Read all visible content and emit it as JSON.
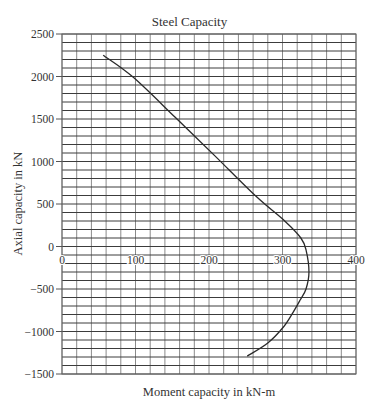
{
  "chart_data": {
    "type": "line",
    "title": "Steel Capacity",
    "xlabel": "Moment capacity in kN-m",
    "ylabel": "Axial capacity in kN",
    "xlim": [
      0,
      400
    ],
    "ylim": [
      -1500,
      2500
    ],
    "x_ticks": [
      0,
      100,
      200,
      300,
      400
    ],
    "y_ticks": [
      2500,
      2000,
      1500,
      1000,
      500,
      0,
      -500,
      -1000,
      -1500
    ],
    "x_minor_step": 20,
    "y_minor_step": 100,
    "grid": true,
    "legend": null,
    "series": [
      {
        "name": "Steel Capacity",
        "x": [
          56,
          97,
          154,
          207,
          264,
          303,
          325,
          332,
          336,
          332,
          324,
          314,
          301,
          280,
          252
        ],
        "y": [
          2250,
          1990,
          1520,
          1075,
          590,
          300,
          100,
          -40,
          -300,
          -500,
          -630,
          -780,
          -950,
          -1135,
          -1290
        ]
      }
    ]
  },
  "labels": {
    "title": "Steel Capacity",
    "xlabel": "Moment capacity in kN-m",
    "ylabel": "Axial capacity in kN"
  },
  "colors": {
    "curve": "#2a2a2a",
    "grid": "#555555",
    "text": "#333333"
  }
}
